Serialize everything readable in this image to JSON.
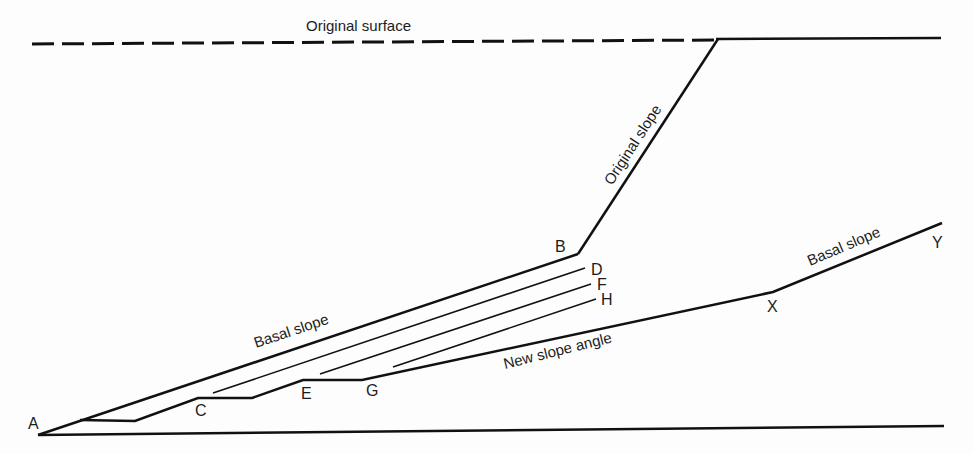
{
  "diagram": {
    "type": "slope-retreat cross-section",
    "labels": {
      "original_surface": "Original surface",
      "original_slope": "Original slope",
      "basal_slope_left": "Basal slope",
      "basal_slope_right": "Basal slope",
      "new_slope_angle": "New slope angle"
    },
    "points": {
      "A": "A",
      "B": "B",
      "C": "C",
      "D": "D",
      "E": "E",
      "F": "F",
      "G": "G",
      "H": "H",
      "X": "X",
      "Y": "Y"
    },
    "colors": {
      "line": "#111111",
      "text": "#1c1c1c",
      "background": "#fdfdfd"
    }
  }
}
